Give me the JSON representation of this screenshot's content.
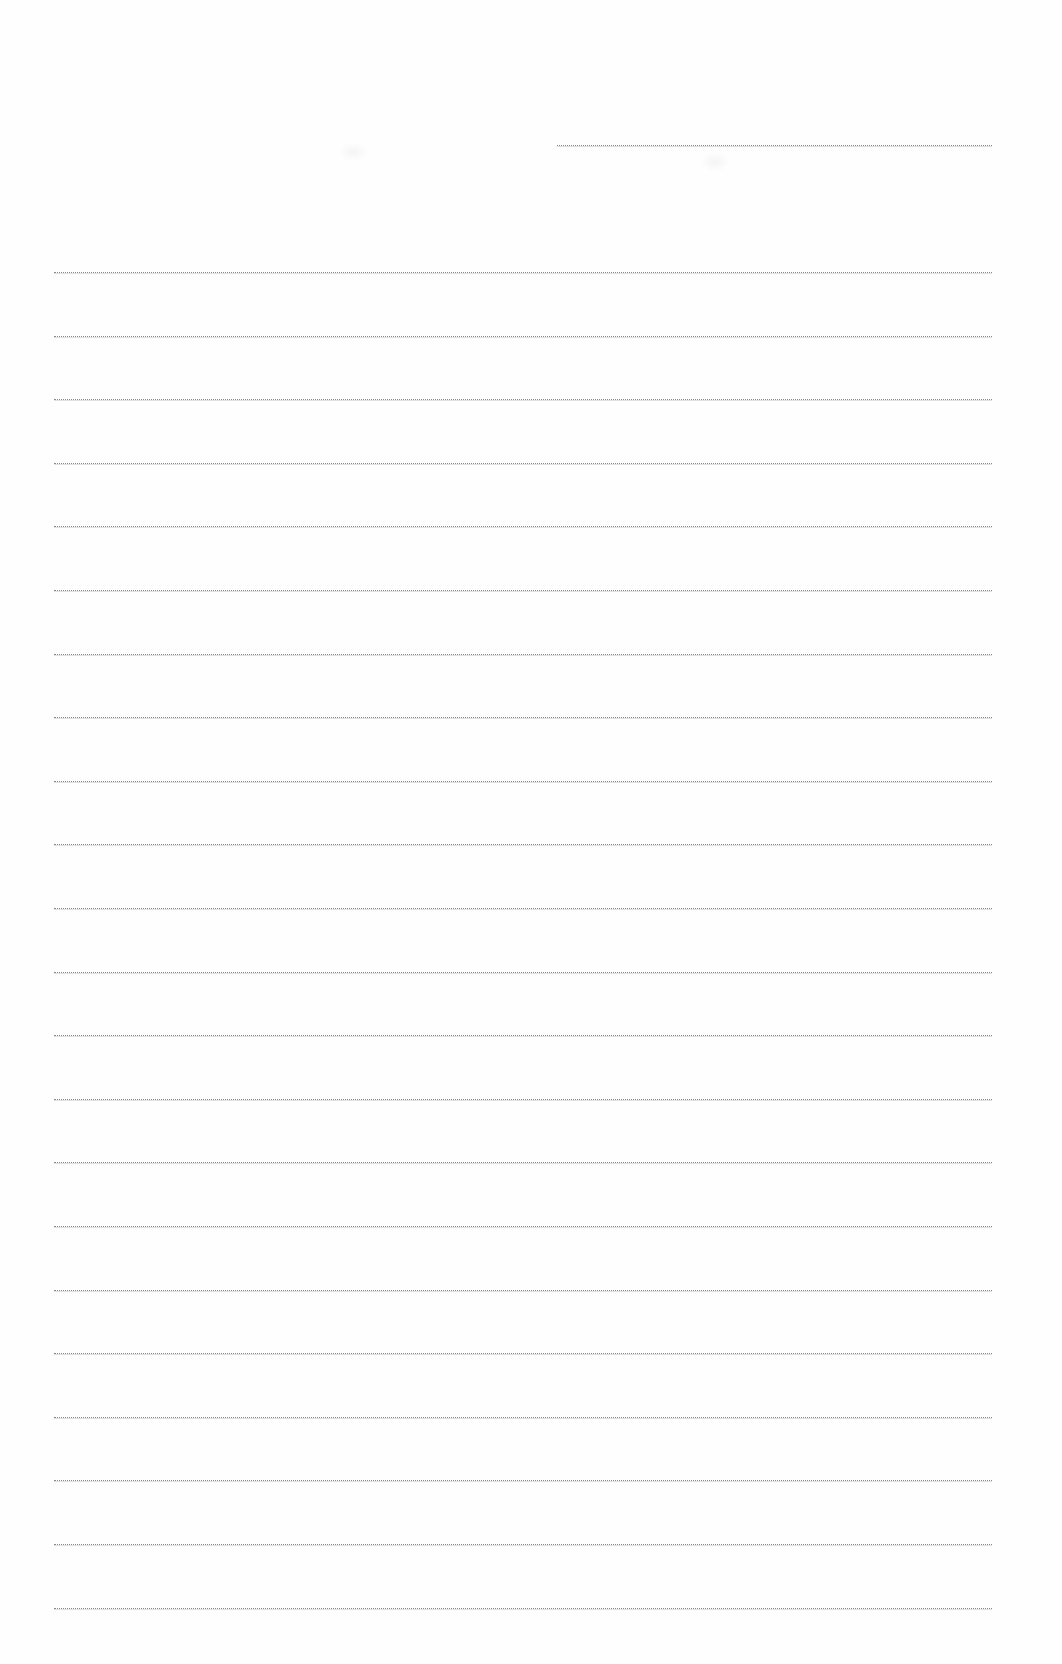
{
  "document": {
    "type": "blank lined writing page",
    "background_color": "#fefefe",
    "rule_color": "#8a8a8a",
    "header_line": {
      "x_start": 557,
      "x_end": 992,
      "y": 145
    },
    "rules": {
      "x_start": 54,
      "x_end": 992,
      "first_y": 272,
      "spacing": 63.6,
      "count": 22
    },
    "text_content": []
  }
}
